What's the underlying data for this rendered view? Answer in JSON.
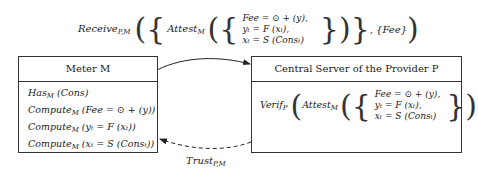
{
  "top_label": {
    "func": "Receive",
    "func_sub": "P,M",
    "inner_func": "Attest",
    "inner_sub": "M",
    "equations": [
      "Fee = ⊙ + (y),",
      "yₜ = F (xₜ),",
      "xₜ = S (Consₜ)"
    ],
    "tail": ", {Fee}"
  },
  "meter": {
    "title": "Meter M",
    "lines": [
      {
        "func": "Has",
        "sub": "M",
        "arg": "(Cons)"
      },
      {
        "func": "Compute",
        "sub": "M",
        "arg": "(Fee = ⊙ + (y))"
      },
      {
        "func": "Compute",
        "sub": "M",
        "arg": "(yₜ = F (xₜ))"
      },
      {
        "func": "Compute",
        "sub": "M",
        "arg": "(xₜ = S (Consₜ))"
      }
    ]
  },
  "server": {
    "title": "Central Server of the Provider P",
    "func": "Verif",
    "func_sub": "P",
    "inner_func": "Attest",
    "inner_sub": "M",
    "equations": [
      "Fee = ⊙ + (y),",
      "yₜ = F (xₜ),",
      "xₜ = S (Consₜ)"
    ]
  },
  "trust_label": {
    "func": "Trust",
    "sub": "P,M"
  },
  "colors": {
    "line": "#333333",
    "background": "#ffffff"
  }
}
